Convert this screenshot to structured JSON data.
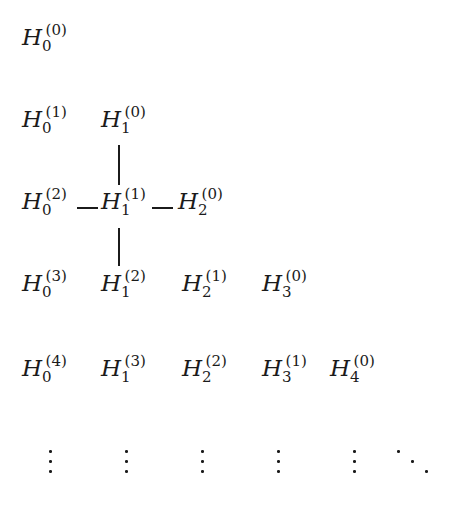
{
  "figure": {
    "kind": "math-array-diagram",
    "background_color": "#ffffff",
    "ink_color": "#1b1b1b"
  },
  "columns_x": [
    22,
    101,
    180,
    261,
    330
  ],
  "rows": [
    {
      "row_index": 0,
      "y": 26,
      "terms": [
        {
          "base": "H",
          "sub": "0",
          "sup": "(0)",
          "col": 0,
          "x": 22
        }
      ]
    },
    {
      "row_index": 1,
      "y": 108,
      "terms": [
        {
          "base": "H",
          "sub": "0",
          "sup": "(1)",
          "col": 0,
          "x": 22
        },
        {
          "base": "H",
          "sub": "1",
          "sup": "(0)",
          "col": 1,
          "x": 101
        }
      ]
    },
    {
      "row_index": 2,
      "y": 190,
      "terms": [
        {
          "base": "H",
          "sub": "0",
          "sup": "(2)",
          "col": 0,
          "x": 22
        },
        {
          "base": "H",
          "sub": "1",
          "sup": "(1)",
          "col": 1,
          "x": 101
        },
        {
          "base": "H",
          "sub": "2",
          "sup": "(0)",
          "col": 2,
          "x": 178
        }
      ]
    },
    {
      "row_index": 3,
      "y": 272,
      "terms": [
        {
          "base": "H",
          "sub": "0",
          "sup": "(3)",
          "col": 0,
          "x": 22
        },
        {
          "base": "H",
          "sub": "1",
          "sup": "(2)",
          "col": 1,
          "x": 101
        },
        {
          "base": "H",
          "sub": "2",
          "sup": "(1)",
          "col": 2,
          "x": 182
        },
        {
          "base": "H",
          "sub": "3",
          "sup": "(0)",
          "col": 3,
          "x": 262
        }
      ]
    },
    {
      "row_index": 4,
      "y": 357,
      "terms": [
        {
          "base": "H",
          "sub": "0",
          "sup": "(4)",
          "col": 0,
          "x": 22
        },
        {
          "base": "H",
          "sub": "1",
          "sup": "(3)",
          "col": 1,
          "x": 101
        },
        {
          "base": "H",
          "sub": "2",
          "sup": "(2)",
          "col": 2,
          "x": 182
        },
        {
          "base": "H",
          "sub": "3",
          "sup": "(1)",
          "col": 3,
          "x": 262
        },
        {
          "base": "H",
          "sub": "4",
          "sup": "(0)",
          "col": 4,
          "x": 330
        }
      ]
    }
  ],
  "ellipsis_row": {
    "row_index": 5,
    "vdots": [
      {
        "x": 49,
        "y": 450
      },
      {
        "x": 125,
        "y": 450
      },
      {
        "x": 201,
        "y": 450
      },
      {
        "x": 277,
        "y": 450
      },
      {
        "x": 353,
        "y": 450
      }
    ],
    "ddots": {
      "x": 397,
      "y": 450,
      "width": 33,
      "height": 23
    }
  },
  "connectors": {
    "horizontal": [
      {
        "label": "edge-row2-col0-col1",
        "x": 77,
        "y": 207,
        "width": 21
      },
      {
        "label": "edge-row2-col1-col2",
        "x": 152,
        "y": 207,
        "width": 21
      }
    ],
    "vertical": [
      {
        "label": "edge-row1-col1-to-row2-col1",
        "x": 118,
        "y": 145,
        "height": 40
      },
      {
        "label": "edge-row2-col1-to-row3-col1",
        "x": 118,
        "y": 228,
        "height": 38
      }
    ]
  }
}
